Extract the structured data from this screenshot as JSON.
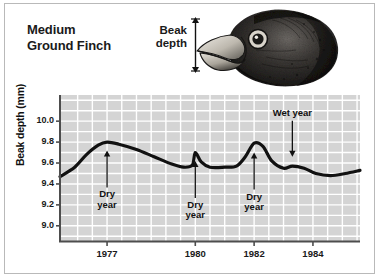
{
  "figure": {
    "species_title": "Medium\nGround Finch",
    "beak_measure_label": "Beak\ndepth",
    "illustration_name": "medium-ground-finch-head-drawing"
  },
  "colors": {
    "plot_background": "#d4d4d4",
    "gridline": "#ffffff",
    "curve": "#111111",
    "axis": "#4d4d4d",
    "frame": "#b9b9b9",
    "text": "#1a1a1a"
  },
  "chart_data": {
    "type": "line",
    "title": "Medium Ground Finch",
    "xlabel": "",
    "ylabel": "Beak depth (mm)",
    "xlim": [
      1975.4,
      1985.6
    ],
    "ylim": [
      8.85,
      10.25
    ],
    "grid": true,
    "legend": null,
    "y_ticks": [
      "10.0",
      "9.8",
      "9.6",
      "9.4",
      "9.2",
      "9.0"
    ],
    "y_tick_values": [
      10.0,
      9.8,
      9.6,
      9.4,
      9.2,
      9.0
    ],
    "x_ticks": [
      "1977",
      "1980",
      "1982",
      "1984"
    ],
    "x_tick_values": [
      1977,
      1980,
      1982,
      1984
    ],
    "series": [
      {
        "name": "Beak depth",
        "x": [
          1975.4,
          1975.9,
          1976.3,
          1976.7,
          1977.0,
          1977.4,
          1978.0,
          1978.6,
          1979.2,
          1979.6,
          1979.9,
          1980.0,
          1980.2,
          1980.5,
          1981.0,
          1981.4,
          1981.7,
          1982.0,
          1982.3,
          1982.6,
          1983.0,
          1983.3,
          1983.7,
          1984.1,
          1984.6,
          1985.1,
          1985.6
        ],
        "y": [
          9.47,
          9.56,
          9.68,
          9.77,
          9.8,
          9.78,
          9.73,
          9.66,
          9.59,
          9.56,
          9.58,
          9.7,
          9.61,
          9.56,
          9.56,
          9.57,
          9.66,
          9.79,
          9.76,
          9.62,
          9.55,
          9.57,
          9.55,
          9.5,
          9.48,
          9.5,
          9.53
        ]
      }
    ],
    "annotations": [
      {
        "label": "Dry\nyear",
        "x": 1977.0,
        "arrow": "up",
        "tip_y": 9.72
      },
      {
        "label": "Dry\nyear",
        "x": 1980.0,
        "arrow": "up",
        "tip_y": 9.62
      },
      {
        "label": "Dry\nyear",
        "x": 1982.0,
        "arrow": "up",
        "tip_y": 9.7
      },
      {
        "label": "Wet year",
        "x": 1983.3,
        "arrow": "down",
        "tip_y": 9.66
      }
    ]
  }
}
